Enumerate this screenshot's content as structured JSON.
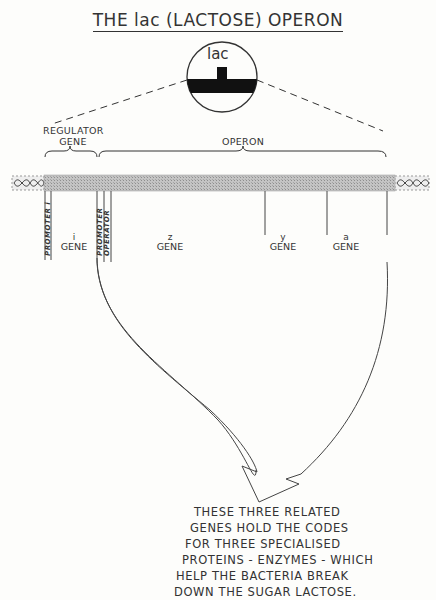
{
  "title": "THE lac (LACTOSE) OPERON",
  "magnifier": {
    "label": "lac"
  },
  "brackets": {
    "regulator": "REGULATOR\nGENE",
    "regulator_line1": "REGULATOR",
    "regulator_line2": "GENE",
    "operon": "OPERON"
  },
  "segments": {
    "promoter_i": "PROMOTER i",
    "promoter": "PROMOTER",
    "operator": "OPERATOR"
  },
  "genes": [
    {
      "letter": "i",
      "label": "GENE"
    },
    {
      "letter": "z",
      "label": "GENE"
    },
    {
      "letter": "y",
      "label": "GENE"
    },
    {
      "letter": "a",
      "label": "GENE"
    }
  ],
  "caption": {
    "lines": [
      "THESE THREE RELATED",
      "GENES HOLD THE CODES",
      "FOR THREE SPECIALISED",
      "PROTEINS - ENZYMES - WHICH",
      "HELP THE BACTERIA BREAK",
      "DOWN THE SUGAR LACTOSE."
    ]
  },
  "colors": {
    "ink": "#333333",
    "dna_bar": "#b8b8b8",
    "dna_hatch": "#9a9a9a"
  }
}
